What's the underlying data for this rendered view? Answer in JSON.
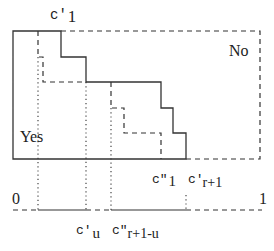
{
  "labels": {
    "c1_prime": {
      "base": "c'",
      "sub": "1"
    },
    "no": "No",
    "yes": "Yes",
    "c1_dprime": {
      "base": "c\"",
      "sub": "1"
    },
    "cr1_prime": {
      "base": "c'",
      "sub": "r+1"
    },
    "zero": "0",
    "one": "1",
    "cu_prime": {
      "base": "c'",
      "sub": "u"
    },
    "cr1u_dprime": {
      "base": "c\"",
      "sub": "r+1-u"
    }
  },
  "colors": {
    "line": "#333333",
    "background": "#ffffff"
  }
}
